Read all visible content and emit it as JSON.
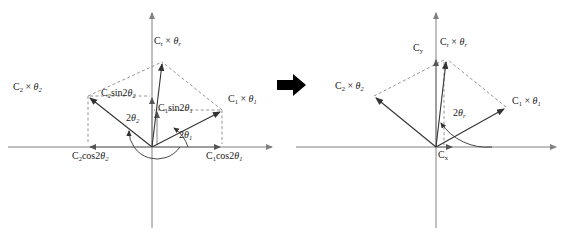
{
  "figure": {
    "type": "vector-phasor-diagram-pair",
    "background_color": "#ffffff",
    "axis_color": "#808080",
    "vector_color": "#3c3c3c",
    "dashed_color": "#8a8a8a",
    "text_color": "#1c1c1c",
    "transition_arrow": {
      "name": "right-arrow",
      "glyph": "➡",
      "color": "#000000"
    }
  },
  "left_diagram": {
    "name": "component-decomposition-diagram",
    "labels": {
      "resultant": {
        "base": "C",
        "sub": "r",
        "times": "×",
        "angle": "θ",
        "angle_sub": "r"
      },
      "vector1": {
        "base": "C",
        "sub": "1",
        "times": "×",
        "angle": "θ",
        "angle_sub": "1"
      },
      "vector2": {
        "base": "C",
        "sub": "2",
        "times": "×",
        "angle": "θ",
        "angle_sub": "2"
      },
      "sin1": {
        "c": "C",
        "c_sub": "1",
        "fn": "sin2",
        "angle": "θ",
        "angle_sub": "1"
      },
      "sin2": {
        "c": "C",
        "c_sub": "2",
        "fn": "sin2",
        "angle": "θ",
        "angle_sub": "2"
      },
      "cos1": {
        "c": "C",
        "c_sub": "1",
        "fn": "cos2",
        "angle": "θ",
        "angle_sub": "1"
      },
      "cos2": {
        "c": "C",
        "c_sub": "2",
        "fn": "cos2",
        "angle": "θ",
        "angle_sub": "2"
      },
      "angle1": {
        "two": "2",
        "theta": "θ",
        "sub": "1"
      },
      "angle2": {
        "two": "2",
        "theta": "θ",
        "sub": "2"
      }
    }
  },
  "right_diagram": {
    "name": "resultant-components-diagram",
    "labels": {
      "resultant": {
        "base": "C",
        "sub": "r",
        "times": "×",
        "angle": "θ",
        "angle_sub": "r"
      },
      "vector1": {
        "base": "C",
        "sub": "1",
        "times": "×",
        "angle": "θ",
        "angle_sub": "1"
      },
      "vector2": {
        "base": "C",
        "sub": "2",
        "times": "×",
        "angle": "θ",
        "angle_sub": "2"
      },
      "cy": {
        "c": "C",
        "sub": "y"
      },
      "cx": {
        "c": "C",
        "sub": "x"
      },
      "angle_r": {
        "two": "2",
        "theta": "θ",
        "sub": "r"
      }
    }
  }
}
